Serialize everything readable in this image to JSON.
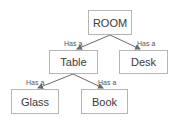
{
  "diagram": {
    "type": "tree",
    "nodes": [
      {
        "id": "room",
        "label": "ROOM"
      },
      {
        "id": "table",
        "label": "Table"
      },
      {
        "id": "desk",
        "label": "Desk"
      },
      {
        "id": "glass",
        "label": "Glass"
      },
      {
        "id": "book",
        "label": "Book"
      }
    ],
    "edges": [
      {
        "from": "room",
        "to": "table",
        "label": "Has a"
      },
      {
        "from": "room",
        "to": "desk",
        "label": "Has a"
      },
      {
        "from": "table",
        "to": "glass",
        "label": "Has a"
      },
      {
        "from": "table",
        "to": "book",
        "label": "Has a"
      }
    ],
    "colors": {
      "node_border": "#b5b5b5",
      "edge": "#6b6b6b",
      "text": "#3a3a3a"
    }
  }
}
